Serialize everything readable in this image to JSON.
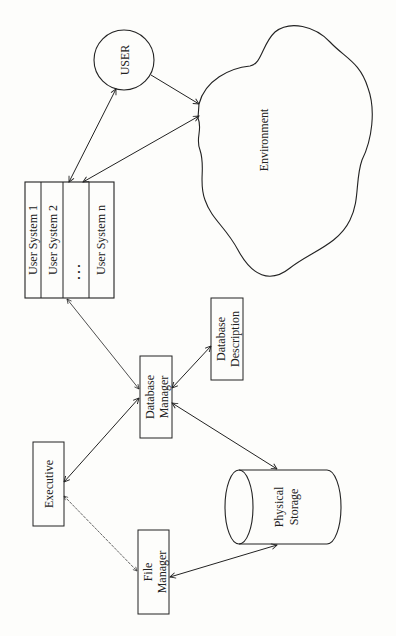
{
  "diagram": {
    "orientation": "rotated -90deg (text reads bottom-to-top)",
    "nodes": {
      "user": {
        "label": "USER",
        "shape": "circle"
      },
      "environment": {
        "label": "Environment",
        "shape": "cloud"
      },
      "user_systems": {
        "shape": "stacked-box",
        "rows": [
          "User System 1",
          "User System 2",
          ". . .",
          "User System n"
        ]
      },
      "database_manager": {
        "label_line1": "Database",
        "label_line2": "Manager",
        "shape": "box"
      },
      "database_description": {
        "label_line1": "Database",
        "label_line2": "Description",
        "shape": "box"
      },
      "executive": {
        "label": "Executive",
        "shape": "box"
      },
      "file_manager": {
        "label_line1": "File",
        "label_line2": "Manager",
        "shape": "box"
      },
      "physical_storage": {
        "label_line1": "Physical",
        "label_line2": "Storage",
        "shape": "cylinder"
      }
    },
    "edges": [
      {
        "from": "user",
        "to": "user_systems",
        "type": "bidirectional"
      },
      {
        "from": "user",
        "to": "environment",
        "type": "directed"
      },
      {
        "from": "user_systems",
        "to": "environment",
        "type": "bidirectional"
      },
      {
        "from": "user_systems",
        "to": "database_manager",
        "type": "bidirectional"
      },
      {
        "from": "database_manager",
        "to": "database_description",
        "type": "bidirectional"
      },
      {
        "from": "database_manager",
        "to": "executive",
        "type": "bidirectional"
      },
      {
        "from": "database_manager",
        "to": "physical_storage",
        "type": "bidirectional"
      },
      {
        "from": "executive",
        "to": "file_manager",
        "type": "bidirectional"
      },
      {
        "from": "file_manager",
        "to": "physical_storage",
        "type": "bidirectional"
      }
    ]
  }
}
